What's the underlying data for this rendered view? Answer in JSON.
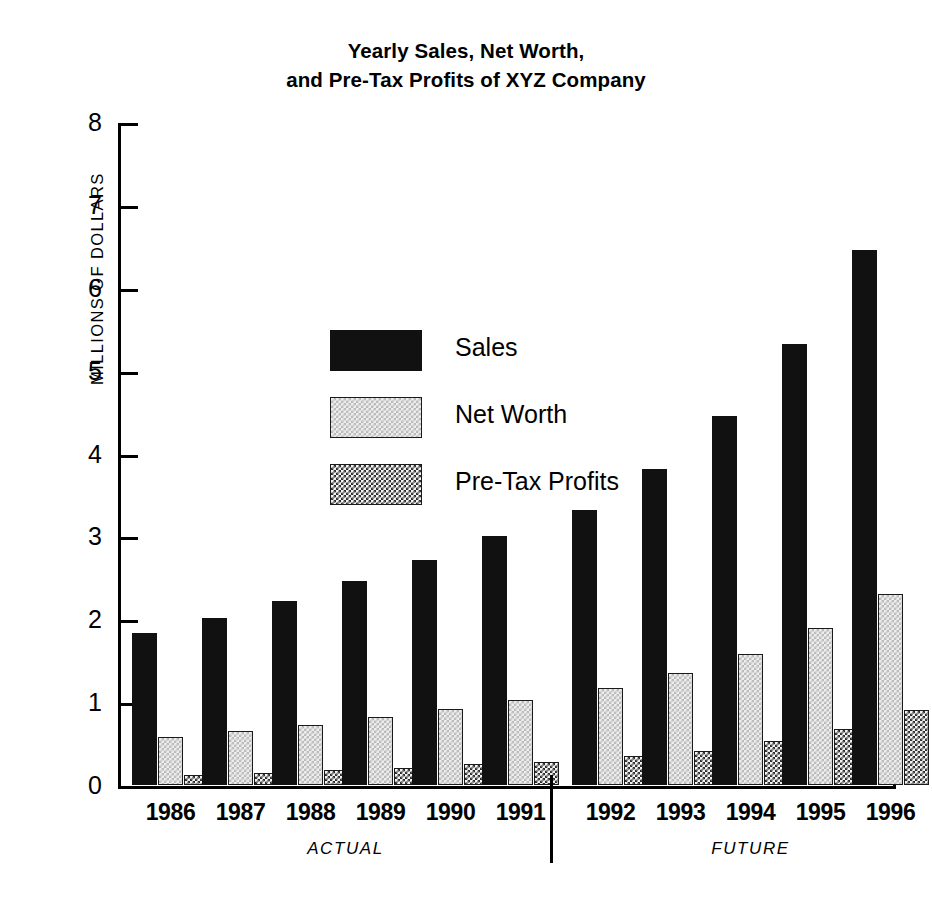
{
  "chart_data": {
    "type": "bar",
    "title": "Yearly Sales, Net Worth, and Pre-Tax Profits of XYZ Company",
    "title_lines": [
      "Yearly Sales, Net Worth,",
      "and Pre-Tax Profits of XYZ Company"
    ],
    "xlabel": "",
    "ylabel": "MILLIONS OF DOLLARS",
    "ylim": [
      0,
      8
    ],
    "ytick_values": [
      0,
      1,
      2,
      3,
      4,
      5,
      6,
      7,
      8
    ],
    "ytick_labels": [
      "0",
      "1",
      "2",
      "3",
      "4",
      "5",
      "6",
      "7",
      "8"
    ],
    "grid": false,
    "legend_position": "upper-left-inside",
    "categories": [
      "1986",
      "1987",
      "1988",
      "1989",
      "1990",
      "1991",
      "1992",
      "1993",
      "1994",
      "1995",
      "1996"
    ],
    "series": [
      {
        "name": "Sales",
        "fill": "solid-black",
        "color": "#111111",
        "values": [
          1.83,
          2.01,
          2.22,
          2.46,
          2.71,
          3.01,
          3.32,
          3.81,
          4.45,
          5.32,
          6.45
        ]
      },
      {
        "name": "Net Worth",
        "fill": "light-checker",
        "color": "#ededed",
        "values": [
          0.58,
          0.65,
          0.73,
          0.82,
          0.92,
          1.03,
          1.17,
          1.35,
          1.58,
          1.9,
          2.3
        ]
      },
      {
        "name": "Pre-Tax Profits",
        "fill": "dark-checker",
        "color": "#2e2e2e",
        "values": [
          0.12,
          0.15,
          0.18,
          0.21,
          0.25,
          0.28,
          0.35,
          0.41,
          0.53,
          0.67,
          0.9
        ]
      }
    ],
    "annotations": [
      {
        "name": "ACTUAL",
        "label": "ACTUAL",
        "categories": [
          "1986",
          "1987",
          "1988",
          "1989",
          "1990",
          "1991"
        ]
      },
      {
        "name": "FUTURE",
        "label": "FUTURE",
        "categories": [
          "1992",
          "1993",
          "1994",
          "1995",
          "1996"
        ]
      }
    ],
    "divider": {
      "between": [
        "1991",
        "1992"
      ],
      "color": "#000000"
    }
  },
  "legend": {
    "items": [
      {
        "label": "Sales",
        "swatch": "sales"
      },
      {
        "label": "Net Worth",
        "swatch": "networth"
      },
      {
        "label": "Pre-Tax Profits",
        "swatch": "pretax"
      }
    ]
  }
}
